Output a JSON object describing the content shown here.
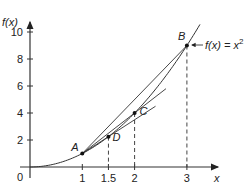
{
  "chart_data": {
    "type": "line",
    "title": "",
    "xlabel": "x",
    "ylabel": "f(x)",
    "curve_label": "f(x) = x",
    "curve_label_sup": "2",
    "function": "x^2",
    "xlim": [
      0,
      3.4
    ],
    "ylim": [
      0,
      11
    ],
    "grid": false,
    "x_ticks": [
      {
        "value": 1,
        "label": "1"
      },
      {
        "value": 1.5,
        "label": "1.5"
      },
      {
        "value": 2,
        "label": "2"
      },
      {
        "value": 3,
        "label": "3"
      }
    ],
    "y_ticks": [
      {
        "value": 2,
        "label": "2"
      },
      {
        "value": 4,
        "label": "4"
      },
      {
        "value": 6,
        "label": "6"
      },
      {
        "value": 8,
        "label": "8"
      },
      {
        "value": 10,
        "label": "10"
      }
    ],
    "origin_label": "0",
    "points": [
      {
        "name": "A",
        "x": 1,
        "y": 1
      },
      {
        "name": "D",
        "x": 1.5,
        "y": 2.25
      },
      {
        "name": "C",
        "x": 2,
        "y": 4
      },
      {
        "name": "B",
        "x": 3,
        "y": 9
      }
    ],
    "chords": [
      {
        "from": "A",
        "to": "D",
        "extend_to_x": 2.4
      },
      {
        "from": "A",
        "to": "C",
        "extend_to_x": 2.6
      },
      {
        "from": "A",
        "to": "B"
      }
    ],
    "dashed_drops": [
      "D",
      "C",
      "B"
    ]
  }
}
